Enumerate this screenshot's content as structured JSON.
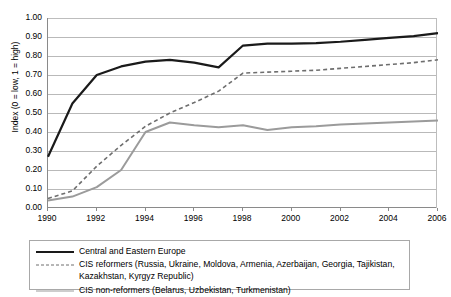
{
  "chart_data": {
    "type": "line",
    "title": "",
    "xlabel": "",
    "ylabel": "Index (0 = low, 1 = high)",
    "xlim": [
      1990,
      2006
    ],
    "ylim": [
      0.0,
      1.0
    ],
    "grid": true,
    "legend_position": "below-plot",
    "x": [
      1990,
      1991,
      1992,
      1993,
      1994,
      1995,
      1996,
      1997,
      1998,
      1999,
      2000,
      2001,
      2002,
      2003,
      2004,
      2005,
      2006
    ],
    "x_tick_labels": [
      "1990",
      "1992",
      "1994",
      "1996",
      "1998",
      "2000",
      "2002",
      "2004",
      "2006"
    ],
    "x_tick_values": [
      1990,
      1992,
      1994,
      1996,
      1998,
      2000,
      2002,
      2004,
      2006
    ],
    "y_tick_labels": [
      "0.00",
      "0.10",
      "0.20",
      "0.30",
      "0.40",
      "0.50",
      "0.60",
      "0.70",
      "0.80",
      "0.90",
      "1.00"
    ],
    "y_tick_values": [
      0.0,
      0.1,
      0.2,
      0.3,
      0.4,
      0.5,
      0.6,
      0.7,
      0.8,
      0.9,
      1.0
    ],
    "series": [
      {
        "name": "Central and Eastern Europe",
        "style": "solid",
        "color": "#1a1a1a",
        "width": 2.2,
        "values": [
          0.27,
          0.55,
          0.7,
          0.745,
          0.77,
          0.78,
          0.765,
          0.74,
          0.855,
          0.865,
          0.865,
          0.868,
          0.875,
          0.885,
          0.895,
          0.905,
          0.92
        ]
      },
      {
        "name": "CIS reformers (Russia, Ukraine, Moldova, Armenia, Azerbaijan, Georgia, Tajikistan, Kazakhstan, Kyrgyz Republic)",
        "style": "dashed",
        "color": "#6e6e6e",
        "width": 1.6,
        "values": [
          0.05,
          0.09,
          0.22,
          0.33,
          0.43,
          0.5,
          0.555,
          0.615,
          0.71,
          0.715,
          0.72,
          0.725,
          0.735,
          0.745,
          0.755,
          0.765,
          0.78
        ]
      },
      {
        "name": "CIS non-reformers (Belarus, Uzbekistan, Turkmenistan)",
        "style": "solid",
        "color": "#9b9b9b",
        "width": 2.0,
        "values": [
          0.04,
          0.06,
          0.11,
          0.2,
          0.4,
          0.45,
          0.435,
          0.425,
          0.435,
          0.41,
          0.425,
          0.43,
          0.44,
          0.445,
          0.45,
          0.455,
          0.46
        ]
      }
    ]
  },
  "axis": {
    "y_title": "Index (0 = low, 1 = high)"
  },
  "legend": {
    "entries": [
      {
        "swatch": "solid-black-line",
        "label": "Central and Eastern Europe",
        "label_cont": ""
      },
      {
        "swatch": "dashed-grey-line",
        "label": "CIS reformers (Russia, Ukraine, Moldova, Armenia, Azerbaijan, Georgia, Tajikistan,",
        "label_cont": "Kazakhstan, Kyrgyz Republic)"
      },
      {
        "swatch": "solid-grey-line",
        "label": "CIS non-reformers (Belarus, Uzbekistan, Turkmenistan)",
        "label_cont": ""
      }
    ]
  }
}
